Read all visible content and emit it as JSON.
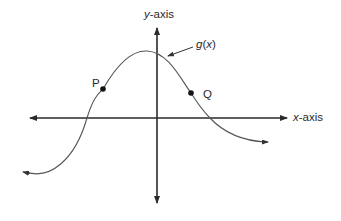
{
  "diagram": {
    "type": "function-graph",
    "axes": {
      "x_label_var": "x",
      "x_label_suffix": "-axis",
      "y_label_var": "y",
      "y_label_suffix": "-axis"
    },
    "function_label": {
      "name": "g",
      "open": "(",
      "var": "x",
      "close": ")"
    },
    "points": [
      {
        "id": "P",
        "label": "P"
      },
      {
        "id": "Q",
        "label": "Q"
      }
    ],
    "colors": {
      "axis": "#2a2a2a",
      "curve": "#555555",
      "point": "#111111",
      "text": "#2a2a2a"
    }
  }
}
